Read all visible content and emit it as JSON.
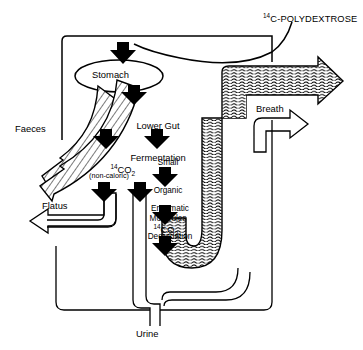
{
  "figure": {
    "kind": "metabolic-fate-flow-diagram",
    "title_compound": {
      "isotope": "14",
      "name": "C-POLYDEXTROSE",
      "full": "14C-POLYDEXTROSE"
    },
    "nodes": {
      "stomach": "Stomach",
      "lower_gut": "Lower Gut\nFermentation",
      "lower_gut_line1": "Lower Gut",
      "lower_gut_line2": "Fermentation",
      "small_organic": "Small\nOrganic\nMolecules",
      "small_organic_line1": "Small",
      "small_organic_line2": "Organic",
      "small_organic_line3": "Molecules",
      "enzymatic": "Enzymatic\nDegradation",
      "enzymatic_line1": "Enzymatic",
      "enzymatic_line2": "Degradation",
      "co2_gut": "14CO2",
      "co2_gut_isotope": "14",
      "co2_gut_body": "CO",
      "co2_gut_sub": "2",
      "non_caloric": "(non-caloric)",
      "co2_tissue": "14CO2",
      "co2_tissue_isotope": "14",
      "co2_tissue_body": "CO",
      "co2_tissue_sub": "2"
    },
    "outputs": {
      "faeces": "Faeces",
      "flatus": "Flatus",
      "breath": "Breath",
      "urine": "Urine"
    },
    "colors": {
      "ink": "#000000",
      "paper": "#ffffff",
      "hatch": "#000000"
    }
  }
}
